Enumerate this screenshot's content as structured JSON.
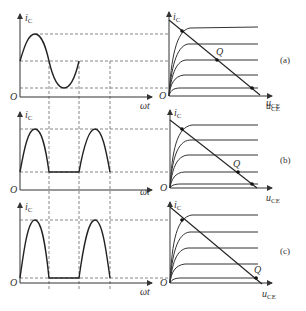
{
  "figure": {
    "panels": [
      {
        "id": "a",
        "caption": "(a)",
        "waveform": {
          "ylabel": "i",
          "ylabel_sub": "C",
          "xlabel": "ωt",
          "origin": "O",
          "shape": "full sine (class A)"
        },
        "output_chars": {
          "ylabel": "i",
          "ylabel_sub": "C",
          "xlabel": "u",
          "xlabel_sub": "CE",
          "origin": "O",
          "q_label": "Q"
        }
      },
      {
        "id": "b",
        "caption": "(b)",
        "waveform": {
          "ylabel": "i",
          "ylabel_sub": "C",
          "xlabel": "ωt",
          "origin": "O",
          "shape": "clipped half-sine with small bias (class AB)"
        },
        "output_chars": {
          "ylabel": "i",
          "ylabel_sub": "C",
          "xlabel": "u",
          "xlabel_sub": "CE",
          "origin": "O",
          "q_label": "Q"
        }
      },
      {
        "id": "c",
        "caption": "(c)",
        "waveform": {
          "ylabel": "i",
          "ylabel_sub": "C",
          "xlabel": "ωt",
          "origin": "O",
          "shape": "half-sine, zero bias (class B)"
        },
        "output_chars": {
          "ylabel": "i",
          "ylabel_sub": "C",
          "xlabel": "u",
          "xlabel_sub": "CE",
          "origin": "O",
          "q_label": "Q"
        }
      }
    ]
  }
}
